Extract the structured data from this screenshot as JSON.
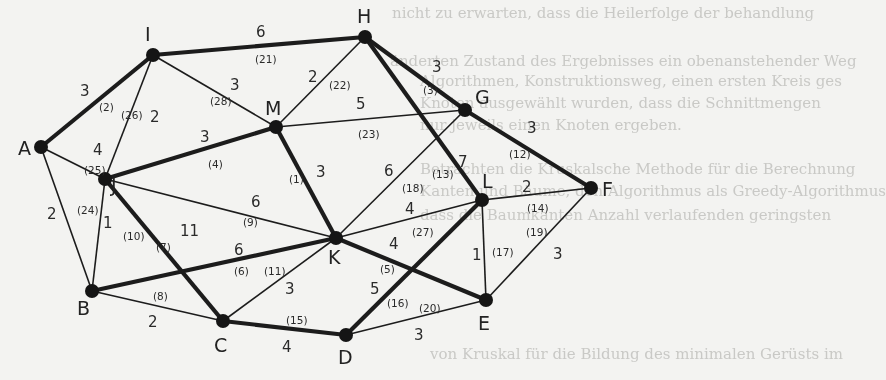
{
  "figure": {
    "type": "weighted-undirected-graph"
  },
  "background_bleed_text": [
    "nicht zu erwarten, dass die Heilerfolge der behandlung",
    "änderten Zustand des Ergebnisses ein obenanstehender Weg",
    "Algorithmen, Konstruktionsweg, einen ersten Kreis ges",
    "Knoten ausgewählt wurden, dass die Schnittmengen",
    "nur jeweils einen Knoten ergeben.",
    "Betrachten die Kruskalsche Methode für die Berechnung",
    "Kanten und Bäume, den Algorithmus als Greedy-Algorithmus",
    "dass die Baumkanten Anzahl verlaufenden geringsten",
    "von Kruskal für die Bildung des minimalen Gerüsts im"
  ],
  "nodes": [
    {
      "id": "A",
      "x": 41,
      "y": 147,
      "lx": 18,
      "ly": 155
    },
    {
      "id": "B",
      "x": 92,
      "y": 291,
      "lx": 77,
      "ly": 315
    },
    {
      "id": "C",
      "x": 223,
      "y": 321,
      "lx": 214,
      "ly": 352
    },
    {
      "id": "D",
      "x": 346,
      "y": 335,
      "lx": 338,
      "ly": 364
    },
    {
      "id": "E",
      "x": 486,
      "y": 300,
      "lx": 478,
      "ly": 330
    },
    {
      "id": "F",
      "x": 591,
      "y": 188,
      "lx": 602,
      "ly": 196
    },
    {
      "id": "G",
      "x": 465,
      "y": 110,
      "lx": 475,
      "ly": 104
    },
    {
      "id": "H",
      "x": 365,
      "y": 37,
      "lx": 357,
      "ly": 23
    },
    {
      "id": "I",
      "x": 153,
      "y": 55,
      "lx": 145,
      "ly": 41
    },
    {
      "id": "J",
      "x": 105,
      "y": 179,
      "lx": 111,
      "ly": 192
    },
    {
      "id": "K",
      "x": 336,
      "y": 238,
      "lx": 328,
      "ly": 264
    },
    {
      "id": "L",
      "x": 482,
      "y": 200,
      "lx": 482,
      "ly": 188
    },
    {
      "id": "M",
      "x": 276,
      "y": 127,
      "lx": 265,
      "ly": 115
    }
  ],
  "edges": [
    {
      "from": "K",
      "to": "M",
      "weight": "3",
      "order": "(1)",
      "thick": true,
      "wx": 316,
      "wy": 177,
      "ox": 289,
      "oy": 183
    },
    {
      "from": "A",
      "to": "I",
      "weight": "3",
      "order": "(2)",
      "thick": true,
      "wx": 80,
      "wy": 96,
      "ox": 99,
      "oy": 111
    },
    {
      "from": "H",
      "to": "G",
      "weight": "3",
      "order": "(3)",
      "thick": true,
      "wx": 432,
      "wy": 72,
      "ox": 423,
      "oy": 94
    },
    {
      "from": "J",
      "to": "M",
      "weight": "3",
      "order": "(4)",
      "thick": true,
      "wx": 200,
      "wy": 142,
      "ox": 208,
      "oy": 168
    },
    {
      "from": "K",
      "to": "E",
      "weight": "4",
      "order": "(5)",
      "thick": true,
      "wx": 389,
      "wy": 249,
      "ox": 380,
      "oy": 273
    },
    {
      "from": "B",
      "to": "K",
      "weight": "6",
      "order": "(6)",
      "thick": true,
      "wx": 234,
      "wy": 255,
      "ox": 234,
      "oy": 275
    },
    {
      "from": "J",
      "to": "C",
      "weight": "11",
      "order": "(7)",
      "thick": true,
      "wx": 180,
      "wy": 236,
      "ox": 156,
      "oy": 251
    },
    {
      "from": "B",
      "to": "C",
      "weight": "2",
      "order": "(8)",
      "thick": false,
      "wx": 148,
      "wy": 327,
      "ox": 153,
      "oy": 300
    },
    {
      "from": "J",
      "to": "K",
      "weight": "6",
      "order": "(9)",
      "thick": false,
      "wx": 251,
      "wy": 207,
      "ox": 243,
      "oy": 226
    },
    {
      "from": "J",
      "to": "B",
      "weight": "1",
      "order": "(10)",
      "thick": false,
      "wx": 103,
      "wy": 228,
      "ox": 123,
      "oy": 240
    },
    {
      "from": "C",
      "to": "K",
      "weight": "3",
      "order": "(11)",
      "thick": false,
      "wx": 285,
      "wy": 294,
      "ox": 264,
      "oy": 275
    },
    {
      "from": "G",
      "to": "F",
      "weight": "3",
      "order": "(12)",
      "thick": true,
      "wx": 527,
      "wy": 133,
      "ox": 509,
      "oy": 158
    },
    {
      "from": "H",
      "to": "L",
      "weight": "7",
      "order": "(13)",
      "thick": true,
      "wx": 458,
      "wy": 167,
      "ox": 432,
      "oy": 178
    },
    {
      "from": "L",
      "to": "F",
      "weight": "2",
      "order": "(14)",
      "thick": false,
      "wx": 522,
      "wy": 192,
      "ox": 527,
      "oy": 212
    },
    {
      "from": "C",
      "to": "D",
      "weight": "4",
      "order": "(15)",
      "thick": true,
      "wx": 282,
      "wy": 352,
      "ox": 286,
      "oy": 324
    },
    {
      "from": "L",
      "to": "D",
      "weight": "5",
      "order": "(16)",
      "thick": true,
      "wx": 370,
      "wy": 294,
      "ox": 387,
      "oy": 307
    },
    {
      "from": "L",
      "to": "E",
      "weight": "1",
      "order": "(17)",
      "thick": false,
      "wx": 472,
      "wy": 260,
      "ox": 492,
      "oy": 256
    },
    {
      "from": "G",
      "to": "K",
      "weight": "6",
      "order": "(18)",
      "thick": false,
      "wx": 384,
      "wy": 176,
      "ox": 402,
      "oy": 192
    },
    {
      "from": "F",
      "to": "E",
      "weight": "3",
      "order": "(19)",
      "thick": false,
      "wx": 553,
      "wy": 259,
      "ox": 526,
      "oy": 236
    },
    {
      "from": "D",
      "to": "E",
      "weight": "3",
      "order": "(20)",
      "thick": false,
      "wx": 414,
      "wy": 340,
      "ox": 419,
      "oy": 312
    },
    {
      "from": "I",
      "to": "H",
      "weight": "6",
      "order": "(21)",
      "thick": true,
      "wx": 256,
      "wy": 37,
      "ox": 255,
      "oy": 63
    },
    {
      "from": "M",
      "to": "H",
      "weight": "2",
      "order": "(22)",
      "thick": false,
      "wx": 308,
      "wy": 82,
      "ox": 329,
      "oy": 89
    },
    {
      "from": "M",
      "to": "G",
      "weight": "5",
      "order": "(23)",
      "thick": false,
      "wx": 356,
      "wy": 109,
      "ox": 358,
      "oy": 138
    },
    {
      "from": "A",
      "to": "B",
      "weight": "2",
      "order": "(24)",
      "thick": false,
      "wx": 47,
      "wy": 219,
      "ox": 77,
      "oy": 214
    },
    {
      "from": "A",
      "to": "J",
      "weight": "4",
      "order": "(25)",
      "thick": false,
      "wx": 93,
      "wy": 155,
      "ox": 84,
      "oy": 174
    },
    {
      "from": "I",
      "to": "J",
      "weight": "2",
      "order": "(26)",
      "thick": false,
      "wx": 150,
      "wy": 122,
      "ox": 121,
      "oy": 119
    },
    {
      "from": "K",
      "to": "L",
      "weight": "4",
      "order": "(27)",
      "thick": false,
      "wx": 405,
      "wy": 214,
      "ox": 412,
      "oy": 236
    },
    {
      "from": "I",
      "to": "M",
      "weight": "3",
      "order": "(28)",
      "thick": false,
      "wx": 230,
      "wy": 90,
      "ox": 210,
      "oy": 105
    }
  ]
}
